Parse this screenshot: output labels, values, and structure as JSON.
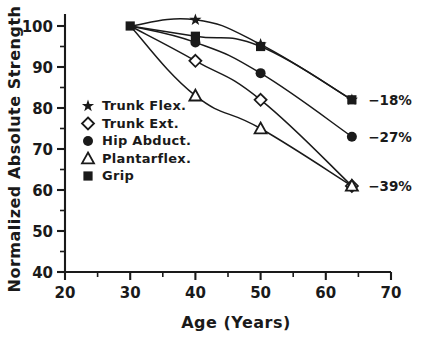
{
  "chart_data": {
    "type": "line",
    "title": "",
    "xlabel": "Age (Years)",
    "ylabel": "Normalized Absolute Strength",
    "xlim": [
      20,
      70
    ],
    "ylim": [
      40,
      103
    ],
    "xticks": [
      20,
      30,
      40,
      50,
      60,
      70
    ],
    "xtick_labels": [
      "20",
      "30",
      "40",
      "50",
      "60",
      "70"
    ],
    "xminor_step": 5,
    "yticks": [
      40,
      50,
      60,
      70,
      80,
      90,
      100
    ],
    "ytick_labels": [
      "40",
      "50",
      "60",
      "70",
      "80",
      "90",
      "100"
    ],
    "yminor_step": 5,
    "grid": false,
    "legend_position": "center-left",
    "x": [
      30,
      40,
      50,
      64
    ],
    "series": [
      {
        "name": "Trunk Flex.",
        "marker": "star",
        "values": [
          100,
          101.5,
          95.5,
          82
        ],
        "annotation": ""
      },
      {
        "name": "Trunk Ext.",
        "marker": "open-diamond",
        "values": [
          100,
          91.5,
          82,
          61
        ],
        "annotation": "-39%"
      },
      {
        "name": "Hip Abduct.",
        "marker": "filled-circle",
        "values": [
          100,
          96,
          88.5,
          73
        ],
        "annotation": "-27%"
      },
      {
        "name": "Plantarflex.",
        "marker": "open-triangle",
        "values": [
          100,
          83,
          75,
          61
        ],
        "annotation": "-39%"
      },
      {
        "name": "Grip",
        "marker": "filled-square",
        "values": [
          100,
          97.5,
          95,
          82
        ],
        "annotation": "-18%"
      }
    ],
    "annotations": [
      {
        "text": "-18%",
        "x": 66.5,
        "y": 82,
        "series": "Grip"
      },
      {
        "text": "-27%",
        "x": 66.5,
        "y": 73,
        "series": "Hip Abduct."
      },
      {
        "text": "-39%",
        "x": 66.5,
        "y": 61,
        "series": "Trunk Ext. / Plantarflex."
      }
    ],
    "legend": [
      {
        "label": "Trunk Flex.",
        "marker": "star"
      },
      {
        "label": "Trunk Ext.",
        "marker": "open-diamond"
      },
      {
        "label": "Hip Abduct.",
        "marker": "filled-circle"
      },
      {
        "label": "Plantarflex.",
        "marker": "open-triangle"
      },
      {
        "label": "Grip",
        "marker": "filled-square"
      }
    ],
    "line_color": "#1a1a1a",
    "background_color": "#ffffff"
  }
}
